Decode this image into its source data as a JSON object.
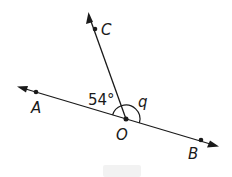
{
  "diagram": {
    "type": "angles on a straight line",
    "points": {
      "A": {
        "label": "A",
        "x": 36,
        "y": 92
      },
      "B": {
        "label": "B",
        "x": 201,
        "y": 140
      },
      "C": {
        "label": "C",
        "x": 95,
        "y": 29
      },
      "O": {
        "label": "O",
        "x": 126,
        "y": 119
      }
    },
    "lines": [
      {
        "name": "line-AB",
        "from": "A",
        "to": "B",
        "arrows": "both"
      },
      {
        "name": "ray-OC",
        "from": "O",
        "to": "C",
        "arrows": "end"
      }
    ],
    "angles": [
      {
        "name": "angle-AOC",
        "label": "54°",
        "between": [
          "OA",
          "OC"
        ]
      },
      {
        "name": "angle-COB",
        "label": "q",
        "between": [
          "OC",
          "OB"
        ]
      }
    ],
    "colors": {
      "ink": "#1a1a1a",
      "background": "#ffffff",
      "footer_box": "#f2f2f2"
    }
  }
}
